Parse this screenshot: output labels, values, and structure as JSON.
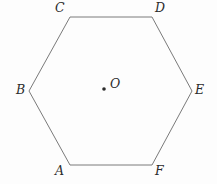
{
  "figure": {
    "shape_name": "hexagon",
    "stroke_color": "#7a7a7a",
    "background_color": "#fdfdfd",
    "label_color": "#2b2b2b",
    "stroke_width": 1,
    "vertices": [
      {
        "id": "A",
        "label": "A",
        "x": 70,
        "y": 165
      },
      {
        "id": "B",
        "label": "B",
        "x": 29,
        "y": 91
      },
      {
        "id": "C",
        "label": "C",
        "x": 70,
        "y": 17
      },
      {
        "id": "D",
        "label": "D",
        "x": 152,
        "y": 17
      },
      {
        "id": "E",
        "label": "E",
        "x": 192,
        "y": 91
      },
      {
        "id": "F",
        "label": "F",
        "x": 152,
        "y": 165
      }
    ],
    "center_point": {
      "id": "O",
      "label": "O",
      "x": 104,
      "y": 89,
      "dot_radius": 1.8
    },
    "polygon_points": "70,17 152,17 192,91 152,165 70,165 29,91"
  }
}
